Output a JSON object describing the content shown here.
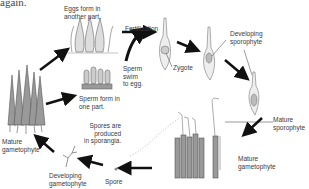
{
  "caption_fragment": "again.",
  "diagram": {
    "labels": {
      "eggs": "Eggs form in\nanother part.",
      "fertilization": "Fertilization",
      "zygote": "Zygote",
      "developing_sporophyte": "Developing\nsporophyte",
      "sperm_swim": "Sperm\nswim\nto egg.",
      "sperm_form": "Sperm form in\none part.",
      "mature_gametophyte_left": "Mature\ngametophyte",
      "spores_produced": "Spores are\nproduced\nin sporangia.",
      "mature_sporophyte": "Mature\nsporophyte",
      "mature_gametophyte_right": "Mature\ngametophyte",
      "developing_gametophyte": "Developing\ngametophyte",
      "spore": "Spore"
    },
    "colors": {
      "arrow": "#111111",
      "plant": "#555555",
      "line": "#888888"
    }
  }
}
